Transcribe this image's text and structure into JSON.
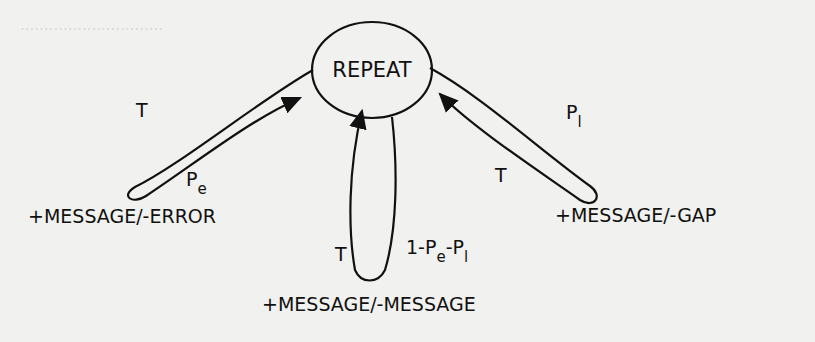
{
  "diagram": {
    "type": "state-transition",
    "state": {
      "label": "REPEAT"
    },
    "loops": [
      {
        "id": "error",
        "out_label": "T",
        "in_label": "P",
        "in_sub": "e",
        "action": "+MESSAGE/-ERROR"
      },
      {
        "id": "message",
        "out_label": "T",
        "in_label": "1-P",
        "in_sub": "e",
        "in_label2": "-P",
        "in_sub2": "l",
        "action": "+MESSAGE/-MESSAGE"
      },
      {
        "id": "gap",
        "out_label": "P",
        "out_sub": "l",
        "in_label": "T",
        "action": "+MESSAGE/-GAP"
      }
    ]
  }
}
